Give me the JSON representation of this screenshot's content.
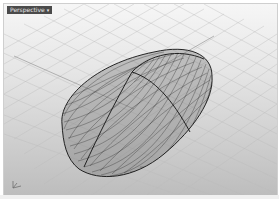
{
  "viewport": {
    "label": "Perspective",
    "label_caret": "▾",
    "background_top": "#f6f6f6",
    "background_bottom": "#bdbdbd",
    "grid_color": "#b8b8b8",
    "grid_major_color": "#8a8a8a",
    "wire_color": "#2a2a2a",
    "edge_color": "#111111",
    "axis_labels": {
      "x": "x",
      "y": "y",
      "z": "z"
    }
  }
}
